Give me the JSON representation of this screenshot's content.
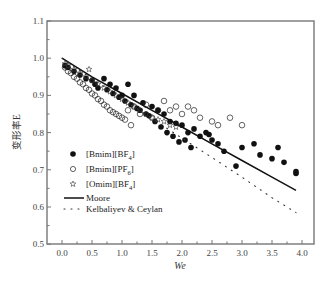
{
  "chart_data": {
    "type": "scatter",
    "title": "",
    "xlabel": "We",
    "ylabel": "变形率E",
    "xlim": [
      -0.25,
      4.2
    ],
    "ylim": [
      0.5,
      1.1
    ],
    "xticks": [
      "0.0",
      "0.5",
      "1.0",
      "1.5",
      "2.0",
      "2.5",
      "3.0",
      "3.5",
      "4.0"
    ],
    "yticks": [
      "0.5",
      "0.6",
      "0.7",
      "0.8",
      "0.9",
      "1.0",
      "1.1"
    ],
    "grid": false,
    "legend_position": "lower-left",
    "series": [
      {
        "name": "[Bmim][BF4]",
        "marker": "filled-circle",
        "points": [
          [
            0.05,
            0.98
          ],
          [
            0.1,
            0.975
          ],
          [
            0.2,
            0.965
          ],
          [
            0.3,
            0.955
          ],
          [
            0.4,
            0.945
          ],
          [
            0.5,
            0.94
          ],
          [
            0.55,
            0.93
          ],
          [
            0.6,
            0.92
          ],
          [
            0.7,
            0.945
          ],
          [
            0.75,
            0.915
          ],
          [
            0.8,
            0.93
          ],
          [
            0.85,
            0.905
          ],
          [
            0.9,
            0.92
          ],
          [
            0.95,
            0.895
          ],
          [
            1.0,
            0.9
          ],
          [
            1.05,
            0.885
          ],
          [
            1.1,
            0.93
          ],
          [
            1.15,
            0.875
          ],
          [
            1.2,
            0.9
          ],
          [
            1.25,
            0.865
          ],
          [
            1.3,
            0.86
          ],
          [
            1.35,
            0.88
          ],
          [
            1.4,
            0.85
          ],
          [
            1.45,
            0.845
          ],
          [
            1.5,
            0.87
          ],
          [
            1.55,
            0.83
          ],
          [
            1.6,
            0.86
          ],
          [
            1.65,
            0.815
          ],
          [
            1.7,
            0.85
          ],
          [
            1.75,
            0.8
          ],
          [
            1.8,
            0.83
          ],
          [
            1.85,
            0.79
          ],
          [
            1.9,
            0.825
          ],
          [
            1.95,
            0.775
          ],
          [
            2.0,
            0.82
          ],
          [
            2.05,
            0.78
          ],
          [
            2.1,
            0.8
          ],
          [
            2.15,
            0.76
          ],
          [
            2.2,
            0.81
          ],
          [
            2.3,
            0.79
          ],
          [
            2.4,
            0.8
          ],
          [
            2.45,
            0.795
          ],
          [
            2.5,
            0.78
          ],
          [
            2.6,
            0.77
          ],
          [
            2.7,
            0.75
          ],
          [
            2.9,
            0.71
          ],
          [
            3.0,
            0.76
          ],
          [
            3.2,
            0.77
          ],
          [
            3.3,
            0.74
          ],
          [
            3.5,
            0.73
          ],
          [
            3.6,
            0.76
          ],
          [
            3.7,
            0.72
          ],
          [
            3.9,
            0.69
          ],
          [
            3.9,
            0.695
          ]
        ]
      },
      {
        "name": "[Bmim][PF6]",
        "marker": "open-circle",
        "points": [
          [
            0.05,
            0.975
          ],
          [
            0.1,
            0.965
          ],
          [
            0.15,
            0.96
          ],
          [
            0.2,
            0.95
          ],
          [
            0.25,
            0.945
          ],
          [
            0.3,
            0.935
          ],
          [
            0.35,
            0.93
          ],
          [
            0.4,
            0.92
          ],
          [
            0.45,
            0.915
          ],
          [
            0.5,
            0.905
          ],
          [
            0.55,
            0.9
          ],
          [
            0.6,
            0.89
          ],
          [
            0.65,
            0.885
          ],
          [
            0.7,
            0.875
          ],
          [
            0.75,
            0.87
          ],
          [
            0.8,
            0.86
          ],
          [
            0.85,
            0.855
          ],
          [
            0.9,
            0.85
          ],
          [
            0.95,
            0.845
          ],
          [
            1.0,
            0.84
          ],
          [
            1.05,
            0.835
          ],
          [
            1.1,
            0.86
          ],
          [
            1.15,
            0.82
          ],
          [
            1.2,
            0.87
          ],
          [
            1.3,
            0.85
          ],
          [
            1.4,
            0.875
          ],
          [
            1.5,
            0.84
          ],
          [
            1.6,
            0.86
          ],
          [
            1.7,
            0.885
          ],
          [
            1.8,
            0.86
          ],
          [
            1.9,
            0.87
          ],
          [
            2.0,
            0.85
          ],
          [
            2.1,
            0.87
          ],
          [
            2.2,
            0.86
          ],
          [
            2.3,
            0.84
          ],
          [
            2.5,
            0.83
          ],
          [
            2.6,
            0.82
          ],
          [
            2.8,
            0.84
          ],
          [
            3.0,
            0.82
          ]
        ]
      },
      {
        "name": "[Omim][BF4]",
        "marker": "star",
        "points": [
          [
            0.05,
            0.985
          ],
          [
            0.1,
            0.98
          ],
          [
            0.2,
            0.97
          ],
          [
            0.3,
            0.96
          ],
          [
            0.4,
            0.95
          ],
          [
            0.45,
            0.97
          ],
          [
            0.5,
            0.94
          ],
          [
            0.6,
            0.93
          ],
          [
            0.7,
            0.92
          ],
          [
            0.8,
            0.91
          ],
          [
            0.9,
            0.9
          ],
          [
            1.0,
            0.89
          ],
          [
            1.1,
            0.88
          ],
          [
            1.2,
            0.87
          ],
          [
            1.3,
            0.86
          ],
          [
            1.4,
            0.85
          ],
          [
            1.5,
            0.84
          ],
          [
            1.6,
            0.835
          ],
          [
            1.7,
            0.83
          ],
          [
            1.8,
            0.82
          ],
          [
            1.9,
            0.815
          ]
        ]
      },
      {
        "name": "Moore",
        "style": "solid-line",
        "x": [
          0.0,
          0.5,
          1.0,
          1.5,
          2.0,
          2.5,
          3.0,
          3.5,
          3.9
        ],
        "values": [
          1.0,
          0.95,
          0.905,
          0.86,
          0.815,
          0.77,
          0.725,
          0.68,
          0.645
        ]
      },
      {
        "name": "Kelbaliyev & Ceylan",
        "style": "dotted-line",
        "x": [
          0.0,
          0.5,
          1.0,
          1.5,
          2.0,
          2.5,
          3.0,
          3.5,
          3.9
        ],
        "values": [
          1.0,
          0.945,
          0.89,
          0.838,
          0.785,
          0.733,
          0.68,
          0.625,
          0.585
        ]
      }
    ]
  },
  "legend": {
    "items": [
      {
        "label": "[Bmim][BF",
        "sub": "4",
        "suffix": "]",
        "symbol": "●"
      },
      {
        "label": "[Bmim][PF",
        "sub": "6",
        "suffix": "]",
        "symbol": "○"
      },
      {
        "label": "[Omim][BF",
        "sub": "4",
        "suffix": "]",
        "symbol": "☆"
      },
      {
        "label": "Moore"
      },
      {
        "label": "Kelbaliyev & Ceylan"
      }
    ]
  },
  "axes": {
    "xlabel": "We",
    "ylabel": "变形率E"
  },
  "colors": {
    "axis": "#666666",
    "marker": "#111111",
    "text": "#333333"
  }
}
